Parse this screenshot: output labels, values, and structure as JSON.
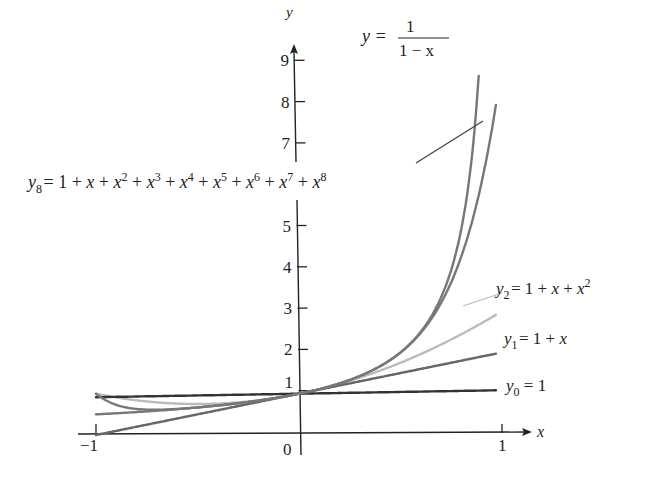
{
  "chart_data": {
    "type": "line",
    "title": "",
    "xlabel": "x",
    "ylabel": "y",
    "xlim": [
      -1,
      1
    ],
    "ylim": [
      0,
      9.5
    ],
    "grid": false,
    "legend": "inline labels beside curves",
    "x_ticks": [
      -1,
      0,
      1
    ],
    "x_tick_labels": [
      "−1",
      "0",
      "1"
    ],
    "y_ticks": [
      1,
      2,
      3,
      4,
      5,
      7,
      8,
      9
    ],
    "y_tick_labels": [
      "1",
      "2",
      "3",
      "4",
      "5",
      "7",
      "8",
      "9"
    ],
    "series": [
      {
        "name": "y0 = 1",
        "formula": "1",
        "color": "#333333",
        "x": [
          -1,
          -0.5,
          0,
          0.5,
          0.97
        ],
        "values": [
          1,
          1,
          1,
          1,
          1
        ]
      },
      {
        "name": "y1 = 1 + x",
        "formula": "1+x",
        "color": "#666666",
        "x": [
          -1,
          -0.5,
          0,
          0.5,
          0.97
        ],
        "values": [
          0,
          0.5,
          1,
          1.5,
          1.97
        ]
      },
      {
        "name": "y2 = 1 + x + x^2",
        "formula": "1+x+x^2",
        "color": "#bbbbbb",
        "x": [
          -1,
          -0.5,
          0,
          0.5,
          0.97
        ],
        "values": [
          1,
          0.75,
          1,
          1.75,
          2.91
        ]
      },
      {
        "name": "y8 = 1 + x + x^2 + x^3 + x^4 + x^5 + x^6 + x^7 + x^8",
        "formula": "sum x^k, k=0..8",
        "color": "#777777",
        "x": [
          -1,
          -0.5,
          0,
          0.5,
          0.8,
          0.9,
          0.97
        ],
        "values": [
          1,
          0.668,
          1,
          1.996,
          4.33,
          6.13,
          7.98
        ]
      },
      {
        "name": "y = 1/(1 - x)",
        "formula": "1/(1-x)",
        "color": "#777777",
        "x": [
          -1,
          -0.5,
          0,
          0.5,
          0.8,
          0.88
        ],
        "values": [
          0.5,
          0.667,
          1,
          2,
          5,
          8.33
        ]
      }
    ]
  },
  "labels": {
    "y_axis": "y",
    "x_axis": "x",
    "f_lhs": "y =",
    "f_num": "1",
    "f_den": "1 − x",
    "y8_text": "y",
    "y8_sub": "8",
    "y8_rhs": " = 1 + x + x",
    "y2_y": "y",
    "y2_sub": "2",
    "y2_rhs": " = 1 + x + x",
    "y1_y": "y",
    "y1_sub": "1",
    "y1_rhs": " = 1 + x",
    "y0_y": "y",
    "y0_sub": "0",
    "y0_rhs": " = 1",
    "sup2": "2"
  }
}
